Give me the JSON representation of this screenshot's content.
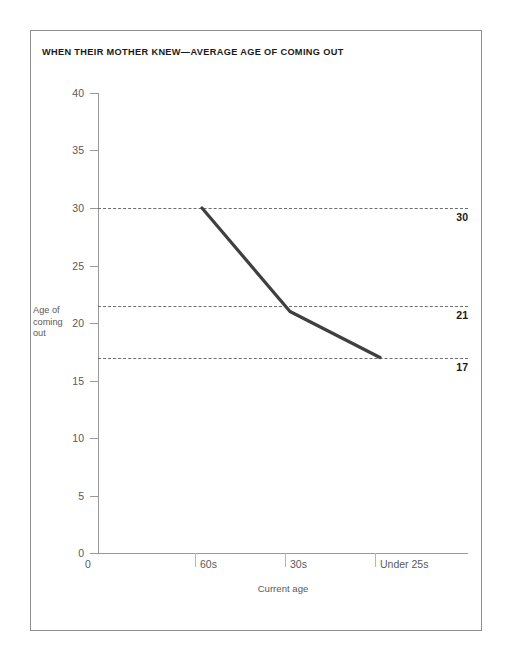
{
  "chart_data": {
    "type": "line",
    "title": "WHEN THEIR MOTHER KNEW—AVERAGE AGE OF COMING OUT",
    "xlabel": "Current age",
    "ylabel": "Age of coming out",
    "categories": [
      "60s",
      "30s",
      "Under 25s"
    ],
    "values": [
      30,
      21,
      17
    ],
    "series": [
      {
        "name": "Average age of coming out",
        "values": [
          30,
          21,
          17
        ]
      }
    ],
    "ylim": [
      0,
      40
    ],
    "y_ticks": [
      0,
      5,
      10,
      15,
      20,
      25,
      30,
      35,
      40
    ],
    "y_tick_labels": [
      "0",
      "5",
      "10",
      "15",
      "20",
      "25",
      "30",
      "35",
      "40"
    ],
    "x_origin_label": "0",
    "grid": "dashed horizontal guides at data values only",
    "legend": "none",
    "annotations": [
      {
        "label": "30",
        "value": 30
      },
      {
        "label": "21",
        "value": 21
      },
      {
        "label": "17",
        "value": 17
      }
    ],
    "colors": {
      "line": "#3f3f41",
      "guide": "#6e6e70",
      "axis": "#9a9a9a",
      "tick_text": "#59595b",
      "title_text": "#1a1a1a",
      "frame": "#8c8c8c",
      "background": "#ffffff"
    }
  },
  "axis": {
    "y_title_lines": [
      "Age of",
      "coming",
      "out"
    ],
    "y_labels": {
      "t40": "40",
      "t35": "35",
      "t30": "30",
      "t25": "25",
      "t20": "20",
      "t15": "15",
      "t10": "10",
      "t5": "5",
      "t0": "0"
    },
    "x_labels": {
      "origin": "0",
      "c0": "60s",
      "c1": "30s",
      "c2": "Under 25s"
    }
  },
  "value_labels": {
    "v0": "30",
    "v1": "21",
    "v2": "17"
  }
}
